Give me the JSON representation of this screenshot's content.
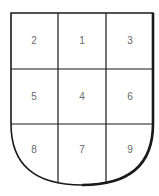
{
  "diagram": {
    "type": "shield-grid",
    "rows": 3,
    "cols": 3,
    "cells": [
      {
        "row": 0,
        "col": 0,
        "label": "2"
      },
      {
        "row": 0,
        "col": 1,
        "label": "1"
      },
      {
        "row": 0,
        "col": 2,
        "label": "3"
      },
      {
        "row": 1,
        "col": 0,
        "label": "5"
      },
      {
        "row": 1,
        "col": 1,
        "label": "4"
      },
      {
        "row": 1,
        "col": 2,
        "label": "6"
      },
      {
        "row": 2,
        "col": 0,
        "label": "8"
      },
      {
        "row": 2,
        "col": 1,
        "label": "7"
      },
      {
        "row": 2,
        "col": 2,
        "label": "9"
      }
    ],
    "stroke_color": "#1a1a1a",
    "label_color": "#6a6a6a"
  }
}
